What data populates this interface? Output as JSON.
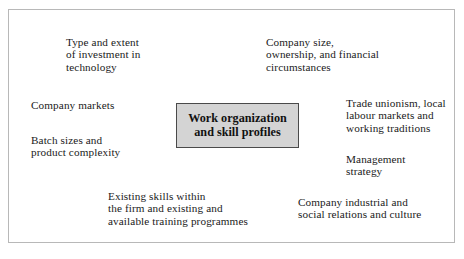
{
  "diagram": {
    "type": "spider-cluster",
    "center": {
      "label": "Work organization\nand skill profiles",
      "fill_color": "#d4d4d4",
      "border_color": "#4a4a4a"
    },
    "frame": {
      "border_color": "#b8b8b8",
      "background_color": "#ffffff"
    },
    "factors": [
      {
        "id": "investment-technology",
        "text": "Type and extent\nof investment in\ntechnology"
      },
      {
        "id": "company-size-ownership",
        "text": "Company size,\nownership, and financial\ncircumstances"
      },
      {
        "id": "company-markets",
        "text": "Company markets"
      },
      {
        "id": "trade-unionism",
        "text": "Trade unionism, local\nlabour markets and\nworking traditions"
      },
      {
        "id": "batch-sizes",
        "text": "Batch sizes and\nproduct complexity"
      },
      {
        "id": "management-strategy",
        "text": "Management\nstrategy"
      },
      {
        "id": "existing-skills",
        "text": "Existing skills within\nthe firm and existing and\navailable training programmes"
      },
      {
        "id": "industrial-relations",
        "text": "Company industrial and\nsocial relations and culture"
      }
    ]
  }
}
